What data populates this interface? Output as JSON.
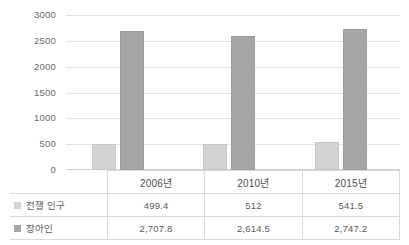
{
  "chart_data": {
    "type": "bar",
    "title": "",
    "subtitle": "",
    "xlabel": "",
    "ylabel": "",
    "categories": [
      "2006년",
      "2010년",
      "2015년"
    ],
    "series": [
      {
        "name": "전잴 인구",
        "swatch_color": "#d3d3d3",
        "values": [
          499.4,
          512,
          541.5
        ],
        "value_labels": [
          "499.4",
          "512",
          "541.5"
        ]
      },
      {
        "name": "장아인",
        "swatch_color": "#a6a6a6",
        "values": [
          2707.8,
          2614.5,
          2747.2
        ],
        "value_labels": [
          "2,707.8",
          "2,614.5",
          "2,747.2"
        ]
      }
    ],
    "ylim": [
      0,
      3000
    ],
    "y_ticks": [
      0,
      500,
      1000,
      1500,
      2000,
      2500,
      3000
    ],
    "y_tick_labels": [
      "0",
      "500",
      "1000",
      "1500",
      "2000",
      "2500",
      "3000"
    ],
    "grid": true,
    "legend_position": "table-left",
    "has_data_table": true
  },
  "table": {
    "corner_label": "",
    "year_headers": [
      "2006년",
      "2010년",
      "2015년"
    ],
    "rows": [
      {
        "legend": "전잴 인구",
        "swatch": "#d3d3d3",
        "cells": [
          "499.4",
          "512",
          "541.5"
        ]
      },
      {
        "legend": "장아인",
        "swatch": "#a6a6a6",
        "cells": [
          "2,707.8",
          "2,614.5",
          "2,747.2"
        ]
      }
    ]
  },
  "colors": {
    "series_0": "#d3d3d3",
    "series_1": "#a6a6a6",
    "gridline": "#e2e2e2",
    "border": "#d9d9d9",
    "text": "#5a5a5a"
  }
}
